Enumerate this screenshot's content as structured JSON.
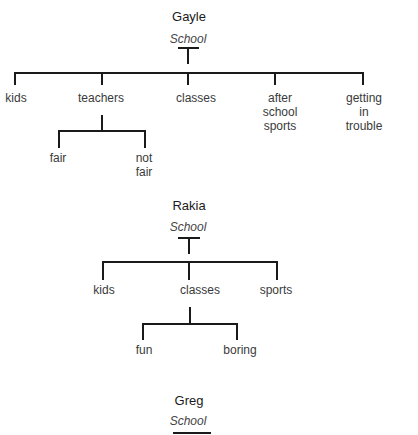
{
  "diagrams": [
    {
      "name": "Gayle",
      "root": "School",
      "children": [
        {
          "label": "kids"
        },
        {
          "label": "teachers",
          "children": [
            {
              "label": "fair"
            },
            {
              "label": "not\nfair"
            }
          ]
        },
        {
          "label": "classes"
        },
        {
          "label": "after\nschool\nsports"
        },
        {
          "label": "getting\nin\ntrouble"
        }
      ]
    },
    {
      "name": "Rakia",
      "root": "School",
      "children": [
        {
          "label": "kids"
        },
        {
          "label": "classes",
          "children": [
            {
              "label": "fun"
            },
            {
              "label": "boring"
            }
          ]
        },
        {
          "label": "sports"
        }
      ]
    },
    {
      "name": "Greg",
      "root": "School",
      "children": []
    }
  ],
  "labels": {
    "gayle": {
      "name": "Gayle",
      "root": "School",
      "kids": "kids",
      "teachers": "teachers",
      "classes": "classes",
      "after_l1": "after",
      "after_l2": "school",
      "after_l3": "sports",
      "getting_l1": "getting",
      "getting_l2": "in",
      "getting_l3": "trouble",
      "fair": "fair",
      "notfair_l1": "not",
      "notfair_l2": "fair"
    },
    "rakia": {
      "name": "Rakia",
      "root": "School",
      "kids": "kids",
      "classes": "classes",
      "sports": "sports",
      "fun": "fun",
      "boring": "boring"
    },
    "greg": {
      "name": "Greg",
      "root": "School"
    }
  }
}
